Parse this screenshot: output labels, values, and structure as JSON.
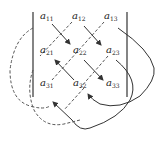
{
  "diagram": {
    "type": "determinant-diagonal-rule",
    "colors": {
      "solid": "#333333",
      "dashed": "#555555",
      "text": "#222222"
    },
    "entries": [
      {
        "base": "a",
        "sub": "11"
      },
      {
        "base": "a",
        "sub": "12"
      },
      {
        "base": "a",
        "sub": "13"
      },
      {
        "base": "a",
        "sub": "21"
      },
      {
        "base": "a",
        "sub": "22"
      },
      {
        "base": "a",
        "sub": "23"
      },
      {
        "base": "a",
        "sub": "31"
      },
      {
        "base": "a",
        "sub": "32"
      },
      {
        "base": "a",
        "sub": "33"
      }
    ]
  }
}
